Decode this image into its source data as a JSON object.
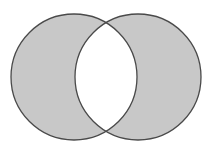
{
  "diagram": {
    "type": "venn-symmetric-difference",
    "colors": {
      "fill": "#c8c8c8",
      "stroke": "#4a4a4a",
      "intersection": "#ffffff",
      "background": "#ffffff"
    },
    "circles": [
      {
        "name": "left-set",
        "cx": 74,
        "cy": 77,
        "r": 63
      },
      {
        "name": "right-set",
        "cx": 138,
        "cy": 77,
        "r": 63
      }
    ]
  }
}
